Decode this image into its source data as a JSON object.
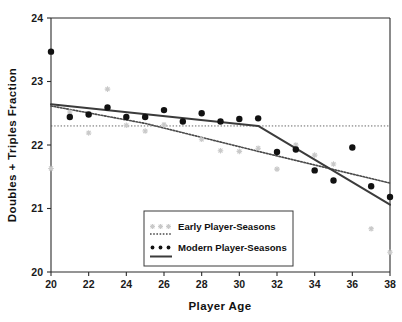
{
  "chart_data": {
    "type": "scatter",
    "title": "",
    "xlabel": "Player  Age",
    "ylabel": "Doubles + Triples  Fraction",
    "xlim": [
      20,
      38
    ],
    "ylim": [
      20,
      24
    ],
    "xticks": [
      20,
      22,
      24,
      26,
      28,
      30,
      32,
      34,
      36,
      38
    ],
    "yticks": [
      20,
      21,
      22,
      23,
      24
    ],
    "grid": false,
    "legend_position": "bottom-center",
    "x": [
      20,
      21,
      22,
      23,
      24,
      25,
      26,
      27,
      28,
      29,
      30,
      31,
      32,
      33,
      34,
      35,
      36,
      37,
      38
    ],
    "series": [
      {
        "name": "Early Player-Seasons",
        "marker": "asterisk",
        "color": "#c9c9c9",
        "values": [
          21.63,
          22.52,
          22.19,
          22.88,
          22.31,
          22.22,
          22.32,
          null,
          22.09,
          21.91,
          21.9,
          21.95,
          21.62,
          22.0,
          21.84,
          21.7,
          null,
          20.68,
          20.31
        ]
      },
      {
        "name": "Modern Player-Seasons",
        "marker": "circle",
        "color": "#111111",
        "values": [
          23.47,
          22.44,
          22.48,
          22.59,
          22.44,
          22.44,
          22.55,
          22.37,
          22.5,
          22.37,
          22.41,
          22.42,
          21.89,
          21.93,
          21.6,
          21.44,
          21.96,
          21.35,
          21.18
        ]
      }
    ],
    "fits": [
      {
        "name": "Early Player-Seasons Fit",
        "style": "dotted",
        "points": [
          [
            20,
            22.615
          ],
          [
            25,
            22.34
          ],
          [
            31,
            21.9
          ],
          [
            38,
            21.4
          ]
        ]
      },
      {
        "name": "Modern Player-Seasons Fit",
        "style": "solid",
        "points": [
          [
            20,
            22.64
          ],
          [
            31,
            22.3
          ],
          [
            38,
            21.06
          ]
        ]
      }
    ],
    "reference_lines": [
      {
        "name": "horizontal-reference",
        "orientation": "horizontal",
        "value": 22.3,
        "style": "dotted"
      }
    ],
    "legend": [
      {
        "label": "Early Player-Seasons",
        "marker": "asterisk-gray",
        "line": "dotted"
      },
      {
        "label": "Modern Player-Seasons",
        "marker": "dot-black",
        "line": "solid"
      }
    ]
  }
}
